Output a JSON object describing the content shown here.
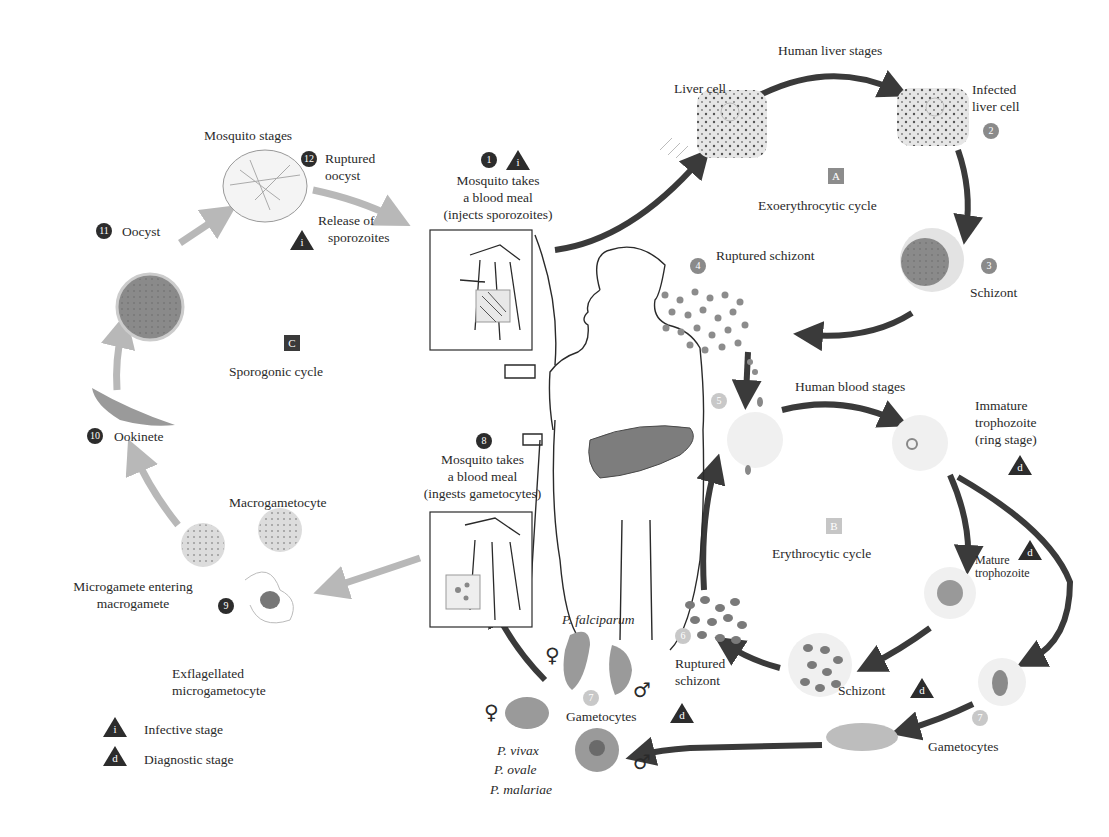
{
  "diagram": {
    "colors": {
      "dark_arrow": "#3a3a3a",
      "mosquito_arrow": "#b8b8b8",
      "cell_fill": "#e6e6e6",
      "parasite_fill": "#8f8f8f",
      "liver_fill": "#7d7d7d",
      "text": "#2a2a2a"
    },
    "regions": {
      "mosquito": {
        "title": "Mosquito stages"
      },
      "liver": {
        "title": "Human liver stages"
      },
      "blood": {
        "title": "Human blood stages"
      }
    },
    "cycles": [
      {
        "letter": "A",
        "label": "Exoerythrocytic cycle"
      },
      {
        "letter": "B",
        "label": "Erythrocytic cycle"
      },
      {
        "letter": "C",
        "label": "Sporogonic cycle"
      }
    ],
    "steps": [
      {
        "num": "1",
        "lines": [
          "Mosquito takes",
          "a blood meal",
          "(injects sporozoites)"
        ],
        "marker": "i"
      },
      {
        "num": "2",
        "lines": [
          "Infected",
          "liver cell"
        ]
      },
      {
        "num": "3",
        "lines": [
          "Schizont"
        ]
      },
      {
        "num": "4",
        "lines": [
          "Ruptured schizont"
        ]
      },
      {
        "num": "5",
        "lines": [
          ""
        ]
      },
      {
        "num": "6",
        "lines": [
          "Ruptured",
          "schizont"
        ]
      },
      {
        "num": "7",
        "lines": [
          "Gametocytes"
        ],
        "marker": "d"
      },
      {
        "num": "8",
        "lines": [
          "Mosquito takes",
          "a blood meal",
          "(ingests gametocytes)"
        ]
      },
      {
        "num": "9",
        "lines": [
          "Microgamete entering",
          "macrogamete"
        ]
      },
      {
        "num": "10",
        "lines": [
          "Ookinete"
        ]
      },
      {
        "num": "11",
        "lines": [
          "Oocyst"
        ]
      },
      {
        "num": "12",
        "lines": [
          "Ruptured",
          "oocyst"
        ]
      }
    ],
    "labels": {
      "liver_cell": "Liver cell",
      "release_sporozoites": [
        "Release of",
        "sporozoites"
      ],
      "immature_trophozoite": [
        "Immature",
        "trophozoite",
        "(ring stage)"
      ],
      "mature_trophozoite": [
        "Mature",
        "trophozoite"
      ],
      "blood_schizont": "Schizont",
      "gametocytes_right": "Gametocytes",
      "macrogametocyte": "Macrogametocyte",
      "exflagellated": [
        "Exflagellated",
        "microgametocyte"
      ],
      "p_falciparum": "P. falciparum",
      "p_vivax": "P. vivax",
      "p_ovale": "P. ovale",
      "p_malariae": "P. malariae",
      "female_symbol": "♀",
      "male_symbol": "♂"
    },
    "legend": [
      {
        "marker": "i",
        "label": "Infective stage"
      },
      {
        "marker": "d",
        "label": "Diagnostic stage"
      }
    ]
  }
}
